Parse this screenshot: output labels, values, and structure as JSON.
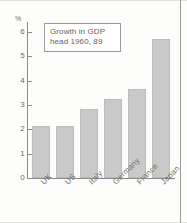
{
  "chart_data": {
    "type": "bar",
    "title": "Growth in GDP head 1960, 89",
    "title_lines": [
      "Growth in GDP",
      "head 1960, 89"
    ],
    "categories": [
      "UK",
      "US",
      "Italy",
      "Germany",
      "France",
      "Japan"
    ],
    "values": [
      2.15,
      2.15,
      2.85,
      3.25,
      3.65,
      5.7
    ],
    "xlabel": "",
    "ylabel": "%",
    "ylim": [
      0,
      6
    ],
    "yticks": [
      0,
      1,
      2,
      3,
      4,
      5,
      6
    ],
    "ytick_labels": [
      "0",
      "1",
      "2",
      "3",
      "4",
      "5",
      "6"
    ],
    "grid": false,
    "legend": "none",
    "bar_color": "#c9c9c9",
    "axis_color": "#8c8c8c",
    "text_color": "#6b6b6b"
  },
  "axis": {
    "unit_symbol": "%"
  }
}
